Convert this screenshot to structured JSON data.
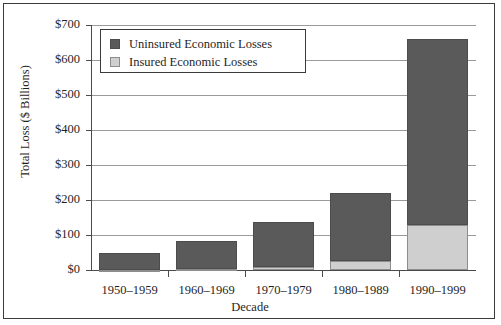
{
  "chart_data": {
    "type": "bar",
    "title": "",
    "xlabel": "Decade",
    "ylabel": "Total Loss ($ Billions)",
    "categories": [
      "1950–1959",
      "1960–1969",
      "1970–1979",
      "1980–1989",
      "1990–1999"
    ],
    "series": [
      {
        "name": "Insured Economic Losses",
        "values": [
          1,
          3,
          8,
          25,
          130
        ],
        "color": "#cfcfcf"
      },
      {
        "name": "Uninsured Economic Losses",
        "values": [
          47,
          79,
          130,
          194,
          530
        ],
        "color": "#5a5a5a"
      }
    ],
    "totals": [
      48,
      82,
      138,
      219,
      660
    ],
    "stacked": true,
    "stack_order": [
      "Insured Economic Losses",
      "Uninsured Economic Losses"
    ],
    "ylim": [
      0,
      700
    ],
    "ytick_values": [
      0,
      100,
      200,
      300,
      400,
      500,
      600,
      700
    ],
    "ytick_labels": [
      "$0",
      "$100",
      "$200",
      "$300",
      "$400",
      "$500",
      "$600",
      "$700"
    ],
    "grid": true,
    "legend_position": "top-left-inside",
    "legend_entries": [
      {
        "label": "Uninsured Economic Losses",
        "color": "#5a5a5a"
      },
      {
        "label": "Insured Economic Losses",
        "color": "#cfcfcf"
      }
    ]
  },
  "colors": {
    "uninsured": "#5a5a5a",
    "insured": "#cfcfcf",
    "grid": "#9a9a9a",
    "axis": "#4a4a4a",
    "frame": "#3b3b3b",
    "background": "#ffffff"
  }
}
